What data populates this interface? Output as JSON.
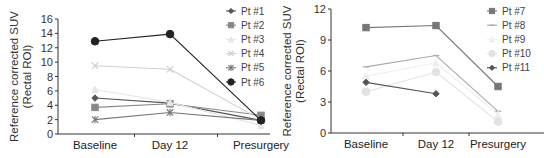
{
  "chart_data": [
    {
      "type": "line",
      "title": "",
      "xlabel": "",
      "ylabel": "Reference corrected SUV (Rectal ROI)",
      "ylabel_lines": [
        "Reference corrected SUV",
        "(Rectal ROI)"
      ],
      "categories": [
        "Baseline",
        "Day 12",
        "Presurgery"
      ],
      "ylim": [
        0,
        16
      ],
      "yticks": [
        0,
        2,
        4,
        6,
        8,
        10,
        12,
        14,
        16
      ],
      "grid": false,
      "legend_position": "right",
      "series": [
        {
          "name": "Pt #1",
          "values": [
            5.0,
            4.3,
            1.9
          ],
          "marker": "diamond",
          "color": "#555555"
        },
        {
          "name": "Pt #2",
          "values": [
            3.7,
            4.2,
            2.6
          ],
          "marker": "square",
          "color": "#888888"
        },
        {
          "name": "Pt #3",
          "values": [
            6.2,
            4.4,
            1.2
          ],
          "marker": "triangle",
          "color": "#e6e6e6"
        },
        {
          "name": "Pt #4",
          "values": [
            9.5,
            9.0,
            2.0
          ],
          "marker": "x",
          "color": "#cfcfcf"
        },
        {
          "name": "Pt #5",
          "values": [
            2.0,
            3.0,
            1.9
          ],
          "marker": "star",
          "color": "#777777"
        },
        {
          "name": "Pt #6",
          "values": [
            12.9,
            13.9,
            1.9
          ],
          "marker": "circle",
          "color": "#222222"
        }
      ]
    },
    {
      "type": "line",
      "title": "",
      "xlabel": "",
      "ylabel": "Reference corrected SUV (Rectal ROI)",
      "ylabel_lines": [
        "Reference corrected SUV",
        "(Rectal ROI)"
      ],
      "categories": [
        "Baseline",
        "Day 12",
        "Presurgery"
      ],
      "ylim": [
        0,
        12
      ],
      "yticks": [
        0,
        3,
        6,
        9,
        12
      ],
      "grid": false,
      "legend_position": "right",
      "series": [
        {
          "name": "Pt #7",
          "values": [
            10.2,
            10.4,
            4.5
          ],
          "marker": "square",
          "color": "#777777"
        },
        {
          "name": "Pt #8",
          "values": [
            6.4,
            7.5,
            2.1
          ],
          "marker": "dash",
          "color": "#aaaaaa"
        },
        {
          "name": "Pt #9",
          "values": [
            5.5,
            6.8,
            1.8
          ],
          "marker": "triangle",
          "color": "#eeeeee"
        },
        {
          "name": "Pt #10",
          "values": [
            4.0,
            5.9,
            1.1
          ],
          "marker": "circle",
          "color": "#e2e2e2"
        },
        {
          "name": "Pt #11",
          "values": [
            4.9,
            3.8,
            null
          ],
          "marker": "diamond",
          "color": "#555555"
        }
      ]
    }
  ]
}
